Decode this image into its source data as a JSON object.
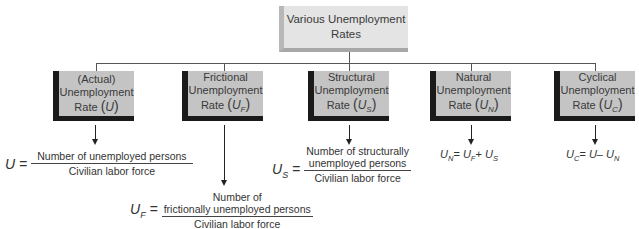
{
  "diagram": {
    "root": {
      "label_line1": "Various Unemployment",
      "label_line2": "Rates"
    },
    "nodes": [
      {
        "id": "actual",
        "line1": "(Actual)",
        "line2": "Unemployment",
        "line3": "Rate",
        "symbol": "U",
        "subscript": ""
      },
      {
        "id": "frictional",
        "line1": "Frictional",
        "line2": "Unemployment",
        "line3": "Rate",
        "symbol": "U",
        "subscript": "F"
      },
      {
        "id": "structural",
        "line1": "Structural",
        "line2": "Unemployment",
        "line3": "Rate",
        "symbol": "U",
        "subscript": "S"
      },
      {
        "id": "natural",
        "line1": "Natural",
        "line2": "Unemployment",
        "line3": "Rate",
        "symbol": "U",
        "subscript": "N"
      },
      {
        "id": "cyclical",
        "line1": "Cyclical",
        "line2": "Unemployment",
        "line3": "Rate",
        "symbol": "U",
        "subscript": "C"
      }
    ],
    "formulas": {
      "actual": {
        "lhs": "U",
        "lhs_sub": "",
        "numerator": "Number of unemployed persons",
        "denominator": "Civilian labor force"
      },
      "frictional": {
        "lhs": "U",
        "lhs_sub": "F",
        "numerator_line1": "Number of",
        "numerator_line2": "frictionally unemployed persons",
        "denominator": "Civilian labor force"
      },
      "structural": {
        "lhs": "U",
        "lhs_sub": "S",
        "numerator_line1": "Number of structurally",
        "numerator_line2": "unemployed persons",
        "denominator": "Civilian labor force"
      },
      "natural": {
        "lhs": "U",
        "lhs_sub": "N",
        "eq": "=",
        "a": "U",
        "a_sub": "F",
        "op": "+",
        "b": "U",
        "b_sub": "S"
      },
      "cyclical": {
        "lhs": "U",
        "lhs_sub": "C",
        "eq": "=",
        "a": "U",
        "a_sub": "",
        "op": "–",
        "b": "U",
        "b_sub": "N"
      }
    },
    "colors": {
      "root_fill": "#e4e4e4",
      "node_fill": "#c4c4c4",
      "node_shadow": "#1a1a1a",
      "line": "#555555"
    }
  }
}
